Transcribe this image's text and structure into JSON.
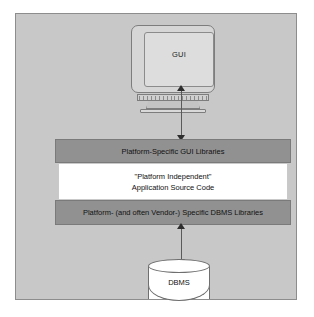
{
  "diagram": {
    "background_color": "#c8c8c8",
    "border_color": "#8d8d8d",
    "nodes": {
      "gui_monitor": {
        "label": "GUI",
        "shape": "crt-monitor",
        "icon": "monitor-icon"
      },
      "database": {
        "label": "DBMS",
        "shape": "cylinder",
        "icon": "database-cylinder-icon"
      }
    },
    "layers": [
      {
        "id": "gui-libraries",
        "label": "Platform-Specific GUI Libraries",
        "fill": "#919191",
        "text_color": "#111111"
      },
      {
        "id": "application-source",
        "label_line1": "\"Platform Independent\"",
        "label_line2": "Application Source Code",
        "fill": "#ffffff",
        "text_color": "#111111"
      },
      {
        "id": "dbms-libraries",
        "label": "Platform- (and often Vendor-) Specific DBMS Libraries",
        "fill": "#919191",
        "text_color": "#111111"
      }
    ],
    "connectors": [
      {
        "id": "gui-to-libraries",
        "from": "gui_monitor",
        "to": "gui-libraries",
        "style": "double-headed-arrow",
        "color": "#2e2e2e"
      },
      {
        "id": "dbms-libraries-to-database",
        "from": "dbms-libraries",
        "to": "database",
        "style": "double-headed-arrow",
        "color": "#2e2e2e"
      }
    ]
  }
}
